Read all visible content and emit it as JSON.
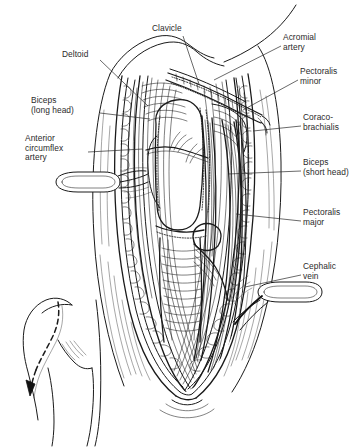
{
  "figure": {
    "type": "anatomical-line-illustration",
    "style": "black-and-white pen-and-ink surgical exposure drawing",
    "line_color": "#1a1a1a",
    "text_color": "#2b2b2b",
    "background_color": "#ffffff",
    "width": 364,
    "height": 447
  },
  "labels": [
    {
      "id": "clavicle",
      "text": "Clavicle",
      "side": "top",
      "x": 152,
      "y": 24,
      "leader": {
        "x1": 183,
        "y1": 36,
        "x2": 199,
        "y2": 84
      }
    },
    {
      "id": "acromial-artery",
      "text": "Acromial\nartery",
      "side": "right",
      "x": 283,
      "y": 33,
      "leader": {
        "x1": 281,
        "y1": 46,
        "x2": 214,
        "y2": 80
      }
    },
    {
      "id": "deltoid",
      "text": "Deltoid",
      "side": "left",
      "x": 62,
      "y": 50,
      "leader": {
        "x1": 100,
        "y1": 60,
        "x2": 148,
        "y2": 106
      }
    },
    {
      "id": "pectoralis-minor",
      "text": "Pectoralis\nminor",
      "side": "right",
      "x": 300,
      "y": 67,
      "leader": {
        "x1": 298,
        "y1": 80,
        "x2": 243,
        "y2": 110
      }
    },
    {
      "id": "biceps-long-head",
      "text": "Biceps\n(long head)",
      "side": "left",
      "x": 31,
      "y": 96,
      "leader": {
        "x1": 100,
        "y1": 113,
        "x2": 150,
        "y2": 119
      }
    },
    {
      "id": "coracobrachialis",
      "text": "Coraco-\nbrachialis",
      "side": "right",
      "x": 303,
      "y": 113,
      "leader": {
        "x1": 301,
        "y1": 126,
        "x2": 253,
        "y2": 131
      }
    },
    {
      "id": "anterior-circumflex-artery",
      "text": "Anterior\ncircumflex\nartery",
      "side": "left",
      "x": 25,
      "y": 134,
      "leader": {
        "x1": 88,
        "y1": 152,
        "x2": 143,
        "y2": 149
      }
    },
    {
      "id": "biceps-short-head",
      "text": "Biceps\n(short head)",
      "side": "right",
      "x": 303,
      "y": 158,
      "leader": {
        "x1": 301,
        "y1": 171,
        "x2": 228,
        "y2": 174
      }
    },
    {
      "id": "pectoralis-major",
      "text": "Pectoralis\nmajor",
      "side": "right",
      "x": 303,
      "y": 208,
      "leader": {
        "x1": 301,
        "y1": 221,
        "x2": 236,
        "y2": 214
      }
    },
    {
      "id": "cephalic-vein",
      "text": "Cephalic\nvein",
      "side": "right",
      "x": 303,
      "y": 262,
      "leader": {
        "x1": 301,
        "y1": 275,
        "x2": 245,
        "y2": 287
      }
    }
  ],
  "inset": {
    "id": "incision-inset",
    "description": "Small outline of shoulder and arm showing the dashed deltopectoral incision line with a directional arrow",
    "has_dashed_incision_line": true,
    "has_direction_arrow": true,
    "x": 10,
    "y": 300,
    "width": 100,
    "height": 140
  },
  "structures": [
    {
      "name": "skin-and-subcutaneous-fat-edge",
      "note": "scalloped lobular wound margins on both sides"
    },
    {
      "name": "deltoid-muscle",
      "note": "lateral retracted muscle belly, striated"
    },
    {
      "name": "pectoralis-major-muscle",
      "note": "medial retracted muscle belly"
    },
    {
      "name": "cephalic-vein",
      "note": "vessel in deltopectoral groove"
    },
    {
      "name": "clavicle",
      "note": "superior bony landmark"
    },
    {
      "name": "acromial-artery",
      "note": "branch crossing superiorly"
    },
    {
      "name": "biceps-long-head-tendon",
      "note": "central vertical tendon in bicipital groove"
    },
    {
      "name": "biceps-short-head",
      "note": "conjoined with coracobrachialis"
    },
    {
      "name": "coracobrachialis-muscle",
      "note": "medial to biceps short head"
    },
    {
      "name": "pectoralis-minor-muscle",
      "note": "deep, superomedial"
    },
    {
      "name": "anterior-circumflex-humeral-artery",
      "note": "transverse vessel"
    },
    {
      "name": "retractor-left",
      "note": "flat oval loop retractor, left margin"
    },
    {
      "name": "retractor-right",
      "note": "flat oval loop retractor, right margin"
    },
    {
      "name": "humerus-shaft",
      "note": "central bone with transverse hatching"
    }
  ]
}
